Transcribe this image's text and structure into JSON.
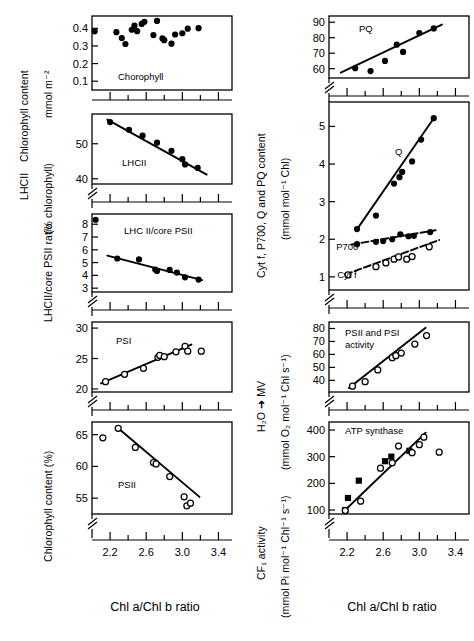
{
  "figure": {
    "x_axis_label": "Chl a/Chl b ratio",
    "x_ticks": [
      "2.2",
      "2.6",
      "3.0",
      "3.4"
    ],
    "x_tick_values": [
      2.2,
      2.6,
      3.0,
      3.4
    ],
    "x_range": [
      2.0,
      3.55
    ],
    "x_minor_step": 0.2
  },
  "left_column": {
    "group_labels": [
      {
        "text": "Chlorophyll content",
        "for": "chlorophyll"
      },
      {
        "text": "mmol m⁻²",
        "for": "chlorophyll"
      },
      {
        "text": "LHCII",
        "for": "lhcii"
      },
      {
        "text": "(% chlorophyll)",
        "for": "lhcii"
      },
      {
        "text": "LHCII/core PSII ratio",
        "for": "lhcii_core"
      },
      {
        "text": "Chlorophyll  content (%)",
        "for": "psi_psii"
      }
    ]
  },
  "right_column": {
    "group_labels": [
      {
        "text": "Cyt f, P700, Q and PQ content",
        "for": "content"
      },
      {
        "text": "(mmol mol⁻¹ Chl)",
        "for": "content"
      },
      {
        "text": "H₂O ➜ MV",
        "for": "activity"
      },
      {
        "text": "(mmol O₂ mol⁻¹ Chl s⁻¹)",
        "for": "activity"
      },
      {
        "text": "CF₁ activity",
        "for": "cf1"
      },
      {
        "text": "(mmol Pi mol⁻¹ Chl⁻¹ s⁻¹)",
        "for": "cf1"
      }
    ]
  },
  "chart_data": [
    {
      "id": "chlorophyll",
      "type": "scatter",
      "title": "Chorophyll",
      "xlabel": "Chl a/Chl b ratio",
      "ylabel": "Chlorophyll content (mmol m⁻²)",
      "ylim": [
        0.05,
        0.47
      ],
      "yticks": [
        0.1,
        0.2,
        0.3,
        0.4
      ],
      "ytick_labels": [
        "0.1",
        "0.2",
        "0.3",
        "0.4"
      ],
      "axis_break": false,
      "trendline": null,
      "series": [
        {
          "name": "Chlorophyll",
          "marker": "filled-circle",
          "points": [
            [
              2.03,
              0.383
            ],
            [
              2.27,
              0.378
            ],
            [
              2.33,
              0.345
            ],
            [
              2.37,
              0.311
            ],
            [
              2.44,
              0.392
            ],
            [
              2.47,
              0.415
            ],
            [
              2.5,
              0.384
            ],
            [
              2.55,
              0.425
            ],
            [
              2.58,
              0.437
            ],
            [
              2.68,
              0.362
            ],
            [
              2.72,
              0.442
            ],
            [
              2.78,
              0.343
            ],
            [
              2.8,
              0.333
            ],
            [
              2.88,
              0.313
            ],
            [
              2.92,
              0.365
            ],
            [
              3.0,
              0.372
            ],
            [
              3.06,
              0.398
            ],
            [
              3.18,
              0.401
            ]
          ]
        }
      ]
    },
    {
      "id": "lhcii",
      "type": "scatter",
      "title": "LHCII",
      "xlabel": "Chl a/Chl b ratio",
      "ylabel": "LHCII (% chlorophyll)",
      "ylim": [
        38.5,
        58.5
      ],
      "yticks": [
        40,
        50
      ],
      "ytick_labels": [
        "40",
        "50"
      ],
      "axis_break": true,
      "trendline": {
        "x": [
          2.17,
          3.27
        ],
        "y": [
          56.9,
          41.2
        ]
      },
      "series": [
        {
          "name": "LHCII",
          "marker": "filled-circle",
          "points": [
            [
              2.2,
              56.2
            ],
            [
              2.41,
              54.0
            ],
            [
              2.56,
              52.3
            ],
            [
              2.72,
              50.3
            ],
            [
              2.88,
              48.0
            ],
            [
              3.0,
              45.6
            ],
            [
              3.03,
              44.1
            ],
            [
              3.17,
              43.1
            ]
          ]
        }
      ]
    },
    {
      "id": "lhcii_core",
      "type": "scatter",
      "title": "LHC II/core PSII",
      "xlabel": "Chl a/Chl b ratio",
      "ylabel": "LHCII/core PSII ratio",
      "ylim": [
        2.7,
        8.8
      ],
      "yticks": [
        3,
        4,
        5,
        6,
        7,
        8
      ],
      "ytick_labels": [
        "3",
        "4",
        "5",
        "6",
        "7",
        "8"
      ],
      "axis_break": true,
      "trendline": {
        "x": [
          2.17,
          3.22
        ],
        "y": [
          5.55,
          3.63
        ]
      },
      "series": [
        {
          "name": "LHCII/core PSII",
          "marker": "filled-circle",
          "points": [
            [
              2.04,
              8.35
            ],
            [
              2.28,
              5.32
            ],
            [
              2.52,
              5.25
            ],
            [
              2.7,
              4.45
            ],
            [
              2.72,
              4.35
            ],
            [
              2.86,
              4.43
            ],
            [
              2.94,
              4.22
            ],
            [
              3.03,
              3.85
            ],
            [
              3.18,
              3.67
            ]
          ]
        }
      ]
    },
    {
      "id": "psi",
      "type": "scatter",
      "title": "PSI",
      "xlabel": "Chl a/Chl b ratio",
      "ylabel": "Chlorophyll content (%)",
      "ylim": [
        19.5,
        31.0
      ],
      "yticks": [
        20,
        25,
        30
      ],
      "ytick_labels": [
        "20",
        "25",
        "30"
      ],
      "axis_break": true,
      "trendline": {
        "x": [
          2.1,
          3.1
        ],
        "y": [
          20.9,
          27.3
        ]
      },
      "series": [
        {
          "name": "PSI",
          "marker": "open-circle",
          "points": [
            [
              2.15,
              21.2
            ],
            [
              2.36,
              22.4
            ],
            [
              2.57,
              23.4
            ],
            [
              2.73,
              25.2
            ],
            [
              2.75,
              25.5
            ],
            [
              2.8,
              25.3
            ],
            [
              2.93,
              26.1
            ],
            [
              3.03,
              27.0
            ],
            [
              3.06,
              26.2
            ],
            [
              3.21,
              26.2
            ]
          ]
        }
      ]
    },
    {
      "id": "psii",
      "type": "scatter",
      "title": "PSII",
      "xlabel": "Chl a/Chl b ratio",
      "ylabel": "Chlorophyll content (%)",
      "ylim": [
        52.5,
        67.0
      ],
      "yticks": [
        55,
        60,
        65
      ],
      "ytick_labels": [
        "55",
        "60",
        "65"
      ],
      "axis_break": true,
      "trendline": {
        "x": [
          2.29,
          3.19
        ],
        "y": [
          66.0,
          55.2
        ]
      },
      "series": [
        {
          "name": "PSII",
          "marker": "open-circle",
          "points": [
            [
              2.12,
              64.5
            ],
            [
              2.29,
              66.0
            ],
            [
              2.48,
              63.0
            ],
            [
              2.68,
              60.6
            ],
            [
              2.71,
              60.4
            ],
            [
              2.86,
              58.4
            ],
            [
              3.02,
              55.2
            ],
            [
              3.05,
              53.8
            ],
            [
              3.09,
              54.2
            ]
          ]
        }
      ]
    },
    {
      "id": "pq",
      "type": "scatter",
      "title": "PQ",
      "xlabel": "Chl a/Chl b ratio",
      "ylabel": "PQ content (mmol mol⁻¹ Chl)",
      "ylim": [
        54,
        94
      ],
      "yticks": [
        60,
        70,
        80,
        90
      ],
      "ytick_labels": [
        "60",
        "70",
        "80",
        "90"
      ],
      "axis_break": true,
      "trendline": {
        "x": [
          2.13,
          3.25
        ],
        "y": [
          57.5,
          88.5
        ]
      },
      "series": [
        {
          "name": "PQ",
          "marker": "filled-circle",
          "points": [
            [
              2.29,
              60.3
            ],
            [
              2.46,
              58.5
            ],
            [
              2.62,
              65.0
            ],
            [
              2.75,
              75.5
            ],
            [
              2.82,
              70.8
            ],
            [
              3.0,
              83.0
            ],
            [
              3.16,
              86.0
            ]
          ]
        }
      ]
    },
    {
      "id": "content",
      "type": "scatter",
      "title": "",
      "xlabel": "Chl a/Chl b ratio",
      "ylabel": "Cyt f, P700, Q and PQ content (mmol mol⁻¹ Chl)",
      "ylim": [
        0.65,
        5.65
      ],
      "yticks": [
        1,
        2,
        3,
        4,
        5
      ],
      "ytick_labels": [
        "1",
        "2",
        "3",
        "4",
        "5"
      ],
      "axis_break": true,
      "annotations": [
        {
          "text": "Q",
          "x": 2.73,
          "y": 4.25
        },
        {
          "text": "P700",
          "x": 2.08,
          "y": 1.72
        },
        {
          "text": "Cyt f",
          "x": 2.09,
          "y": 0.96
        }
      ],
      "series": [
        {
          "name": "Q",
          "marker": "filled-circle",
          "trendline": {
            "x": [
              2.3,
              3.16
            ],
            "y": [
              2.23,
              5.22
            ]
          },
          "points": [
            [
              2.31,
              2.27
            ],
            [
              2.52,
              2.63
            ],
            [
              2.72,
              3.48
            ],
            [
              2.78,
              3.65
            ],
            [
              2.81,
              3.79
            ],
            [
              2.92,
              4.07
            ],
            [
              3.02,
              4.65
            ],
            [
              3.16,
              5.22
            ]
          ]
        },
        {
          "name": "P700",
          "marker": "filled-circle",
          "dashed": true,
          "trendline": {
            "x": [
              2.25,
              3.18
            ],
            "y": [
              1.86,
              2.24
            ]
          },
          "points": [
            [
              2.31,
              1.87
            ],
            [
              2.52,
              1.93
            ],
            [
              2.6,
              1.95
            ],
            [
              2.7,
              2.0
            ],
            [
              2.79,
              2.13
            ],
            [
              2.88,
              2.08
            ],
            [
              2.94,
              2.09
            ],
            [
              3.12,
              2.19
            ]
          ]
        },
        {
          "name": "Cyt f",
          "marker": "open-circle",
          "dashed": true,
          "trendline": {
            "x": [
              2.18,
              3.22
            ],
            "y": [
              1.06,
              1.98
            ]
          },
          "points": [
            [
              2.21,
              1.05
            ],
            [
              2.52,
              1.27
            ],
            [
              2.63,
              1.37
            ],
            [
              2.72,
              1.47
            ],
            [
              2.77,
              1.53
            ],
            [
              2.86,
              1.47
            ],
            [
              2.92,
              1.54
            ],
            [
              3.11,
              1.8
            ]
          ]
        }
      ]
    },
    {
      "id": "activity",
      "type": "scatter",
      "title": "PSII and PSI activity",
      "xlabel": "Chl a/Chl b ratio",
      "ylabel": "H₂O ➜ MV (mmol O₂ mol⁻¹ Chl s⁻¹)",
      "ylim": [
        31,
        85
      ],
      "yticks": [
        40,
        50,
        60,
        70,
        80
      ],
      "ytick_labels": [
        "40",
        "50",
        "60",
        "70",
        "80"
      ],
      "axis_break": true,
      "trendline": {
        "x": [
          2.22,
          3.07
        ],
        "y": [
          34.0,
          80.5
        ]
      },
      "series": [
        {
          "name": "PSII and PSI activity",
          "marker": "open-circle",
          "points": [
            [
              2.26,
              35.5
            ],
            [
              2.4,
              39.0
            ],
            [
              2.54,
              48.0
            ],
            [
              2.7,
              57.5
            ],
            [
              2.74,
              59.0
            ],
            [
              2.8,
              61.0
            ],
            [
              2.95,
              68.0
            ],
            [
              3.08,
              74.5
            ]
          ]
        }
      ]
    },
    {
      "id": "cf1",
      "type": "scatter",
      "title": "ATP synthase",
      "xlabel": "Chl a/Chl b ratio",
      "ylabel": "CF₁ activity (mmol Pi mol⁻¹ Chl⁻¹ s⁻¹)",
      "ylim": [
        85,
        430
      ],
      "yticks": [
        100,
        200,
        300,
        400
      ],
      "ytick_labels": [
        "100",
        "200",
        "300",
        "400"
      ],
      "axis_break": true,
      "trendline": {
        "x": [
          2.18,
          3.07
        ],
        "y": [
          100,
          390
        ]
      },
      "series": [
        {
          "name": "CF1 (squares)",
          "marker": "filled-square",
          "points": [
            [
              2.18,
              100
            ],
            [
              2.21,
              145
            ],
            [
              2.33,
              210
            ],
            [
              2.62,
              283
            ],
            [
              2.69,
              300
            ],
            [
              2.89,
              322
            ]
          ]
        },
        {
          "name": "CF1 (circles)",
          "marker": "open-circle",
          "points": [
            [
              2.18,
              98
            ],
            [
              2.35,
              133
            ],
            [
              2.57,
              257
            ],
            [
              2.7,
              277
            ],
            [
              2.77,
              340
            ],
            [
              2.92,
              315
            ],
            [
              3.0,
              345
            ],
            [
              3.05,
              373
            ],
            [
              3.22,
              317
            ]
          ]
        }
      ]
    }
  ]
}
